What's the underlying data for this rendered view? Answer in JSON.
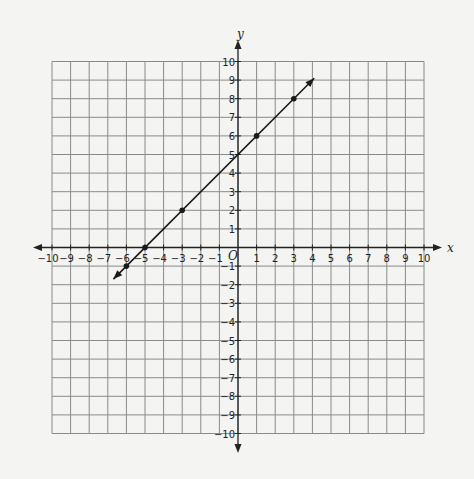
{
  "chart_data": {
    "type": "line",
    "title": "",
    "xlabel": "x",
    "ylabel": "y",
    "origin_label": "O",
    "xlim": [
      -10,
      10
    ],
    "ylim": [
      -10,
      10
    ],
    "grid": true,
    "x_ticks": [
      -10,
      -9,
      -8,
      -7,
      -6,
      -5,
      -4,
      -3,
      -2,
      -1,
      1,
      2,
      3,
      4,
      5,
      6,
      7,
      8,
      9,
      10
    ],
    "y_ticks": [
      -10,
      -9,
      -8,
      -7,
      -6,
      -5,
      -4,
      -3,
      -2,
      -1,
      1,
      2,
      3,
      4,
      5,
      6,
      7,
      8,
      9,
      10
    ],
    "line": {
      "equation": "y = x + 5",
      "slope": 1,
      "intercept": 5,
      "start": [
        -6.7,
        -1.7
      ],
      "end": [
        4.1,
        9.1
      ],
      "arrows": "both"
    },
    "points": [
      {
        "x": -6,
        "y": -1
      },
      {
        "x": -5,
        "y": 0
      },
      {
        "x": -3,
        "y": 2
      },
      {
        "x": 1,
        "y": 6
      },
      {
        "x": 3,
        "y": 8
      }
    ],
    "colors": {
      "grid": "#8a8a8a",
      "axis": "#222222",
      "line": "#1a1a1a",
      "background": "#f4f4f2"
    }
  }
}
